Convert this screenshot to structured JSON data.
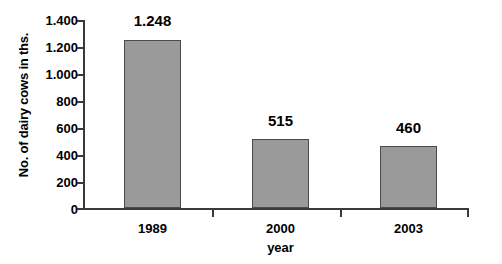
{
  "chart_data": {
    "type": "bar",
    "title": "",
    "categories": [
      "1989",
      "2000",
      "2003"
    ],
    "values": [
      1248,
      515,
      460
    ],
    "value_labels": [
      "1.248",
      "515",
      "460"
    ],
    "series": [
      {
        "name": "No. of dairy cows in ths.",
        "values": [
          1248,
          515,
          460
        ]
      }
    ],
    "xlabel": "year",
    "ylabel": "No. of dairy cows in ths.",
    "ylim": [
      0,
      1400
    ],
    "ytick_values": [
      0,
      200,
      400,
      600,
      800,
      1000,
      1200,
      1400
    ],
    "ytick_labels": [
      "0",
      "200",
      "400",
      "600",
      "800",
      "1.000",
      "1.200",
      "1.400"
    ],
    "grid": false,
    "legend": false,
    "bar_color": "#9a9a9a",
    "bar_border_color": "#4a4a4a",
    "axis_color": "#3a3a3a",
    "background": "#ffffff"
  }
}
